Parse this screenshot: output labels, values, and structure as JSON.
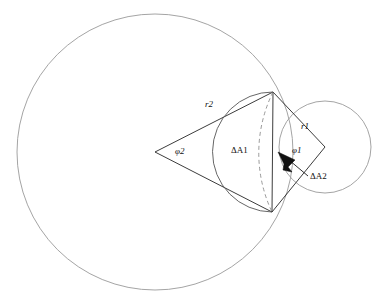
{
  "figure": {
    "background_color": "#ffffff",
    "stroke_color_circles": "#9a9a9a",
    "stroke_color_lines": "#262626",
    "width": 385,
    "height": 302
  },
  "labels": {
    "r2": "r2",
    "r1": "r1",
    "phi2": "φ2",
    "phi1": "φ1",
    "delta_a1": "ΔA1",
    "delta_a2": "ΔA2"
  },
  "geometry": {
    "big_circle": {
      "cx": 155,
      "cy": 152,
      "r": 138
    },
    "small_circle": {
      "cx": 325,
      "cy": 147,
      "r": 46
    },
    "intersection_top": {
      "x": 273,
      "y": 92
    },
    "intersection_bottom": {
      "x": 272,
      "y": 212
    },
    "apex_phi2": {
      "x": 155,
      "y": 152
    },
    "apex_phi1": {
      "x": 325,
      "y": 147
    },
    "chord_top": {
      "x": 273,
      "y": 92
    },
    "chord_bottom": {
      "x": 272,
      "y": 212
    }
  }
}
